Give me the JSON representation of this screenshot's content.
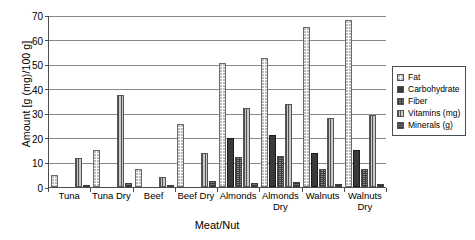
{
  "chart_data": {
    "type": "bar",
    "title": "",
    "xlabel": "Meat/Nut",
    "ylabel": "Amount [g (mg)/100 g]",
    "ylim": [
      0,
      70
    ],
    "yticks": [
      0,
      10,
      20,
      30,
      40,
      50,
      60,
      70
    ],
    "grid": true,
    "legend_position": "right",
    "categories": [
      "Tuna",
      "Tuna Dry",
      "Beef",
      "Beef Dry",
      "Almonds",
      "Almonds Dry",
      "Walnuts",
      "Walnuts Dry"
    ],
    "series": [
      {
        "name": "Fat",
        "style": "fat",
        "values": [
          4.8,
          15.2,
          7.2,
          25.5,
          50.5,
          52.7,
          65.2,
          68.0
        ]
      },
      {
        "name": "Carbohydrate",
        "style": "carb",
        "values": [
          0,
          0,
          0,
          0,
          20.1,
          21.2,
          14.0,
          14.9
        ]
      },
      {
        "name": "Fiber",
        "style": "fiber",
        "values": [
          0,
          0,
          0,
          0,
          12.1,
          12.8,
          7.2,
          7.5
        ]
      },
      {
        "name": "Vitamins (mg)",
        "style": "vit",
        "values": [
          11.8,
          37.5,
          4.0,
          13.7,
          32.2,
          33.8,
          28.2,
          29.5
        ]
      },
      {
        "name": "Minerals (g)",
        "style": "min",
        "values": [
          0.8,
          1.8,
          0.9,
          2.3,
          1.8,
          1.9,
          1.4,
          1.4
        ]
      }
    ]
  },
  "legend": {
    "entries": [
      "Fat",
      "Carbohydrate",
      "Fiber",
      "Vitamins (mg)",
      "Minerals (g)"
    ]
  },
  "colors": {
    "axis": "#4d4d4d",
    "gridline": "#8a8a8a",
    "text": "#000000",
    "background": "#ffffff"
  }
}
